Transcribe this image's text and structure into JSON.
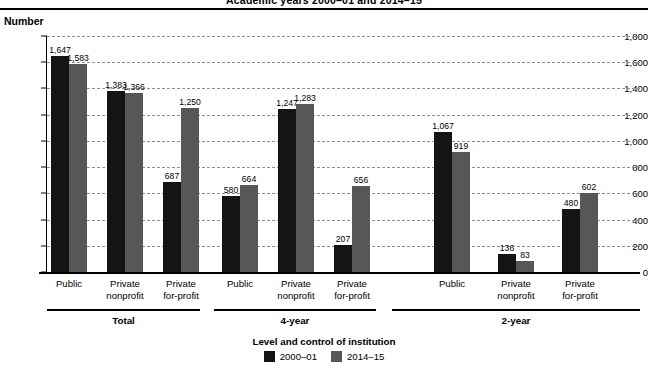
{
  "title": "Academic years 2000–01 and 2014–15",
  "axis": {
    "ylabel": "Number",
    "xlabel": "Level and control of institution",
    "yticks": [
      "0",
      "200",
      "400",
      "600",
      "800",
      "1,000",
      "1,200",
      "1,400",
      "1,600",
      "1,800"
    ]
  },
  "legend": {
    "title": "Level and control of institution",
    "items": [
      {
        "label": "2000–01",
        "color": "#141414"
      },
      {
        "label": "2014–15",
        "color": "#575757"
      }
    ]
  },
  "groups": [
    {
      "label": "Total"
    },
    {
      "label": "4-year"
    },
    {
      "label": "2-year"
    }
  ],
  "categories": [
    "Public",
    "Private\nnonprofit",
    "Private\nfor-profit",
    "Public",
    "Private\nnonprofit",
    "Private\nfor-profit",
    "Public",
    "Private\nnonprofit",
    "Private\nfor-profit"
  ],
  "bar_labels": [
    "1,647",
    "1,583",
    "1,383",
    "1,366",
    "687",
    "1,250",
    "580",
    "664",
    "1,247",
    "1,283",
    "207",
    "656",
    "1,067",
    "919",
    "136",
    "83",
    "480",
    "602"
  ],
  "chart_data": {
    "type": "bar",
    "title": "Academic years 2000–01 and 2014–15",
    "xlabel": "Level and control of institution",
    "ylabel": "Number",
    "ylim": [
      0,
      1800
    ],
    "ytick_step": 200,
    "grid": true,
    "legend_position": "bottom",
    "group_labels": [
      "Total",
      "4-year",
      "2-year"
    ],
    "categories": [
      "Total — Public",
      "Total — Private nonprofit",
      "Total — Private for-profit",
      "4-year — Public",
      "4-year — Private nonprofit",
      "4-year — Private for-profit",
      "2-year — Public",
      "2-year — Private nonprofit",
      "2-year — Private for-profit"
    ],
    "series": [
      {
        "name": "2000–01",
        "color": "#141414",
        "values": [
          1647,
          1383,
          687,
          580,
          1247,
          207,
          1067,
          136,
          480
        ]
      },
      {
        "name": "2014–15",
        "color": "#575757",
        "values": [
          1583,
          1366,
          1250,
          664,
          1283,
          656,
          919,
          83,
          602
        ]
      }
    ]
  }
}
